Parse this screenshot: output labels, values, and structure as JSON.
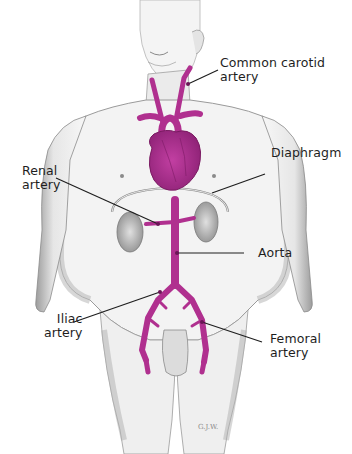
{
  "figure": {
    "colors": {
      "artery": "#b0308f",
      "artery_dark": "#8a1f6e",
      "skin_shade": "#9a9a9a",
      "outline": "#6a6a6a",
      "leader": "#1e1e1e"
    },
    "labels": {
      "common_carotid": {
        "line1": "Common carotid",
        "line2": "artery"
      },
      "diaphragm": {
        "line1": "Diaphragm"
      },
      "renal": {
        "line1": "Renal",
        "line2": "artery"
      },
      "aorta": {
        "line1": "Aorta"
      },
      "iliac": {
        "line1": "Iliac",
        "line2": "artery"
      },
      "femoral": {
        "line1": "Femoral",
        "line2": "artery"
      }
    },
    "credit": "G.J.W."
  }
}
